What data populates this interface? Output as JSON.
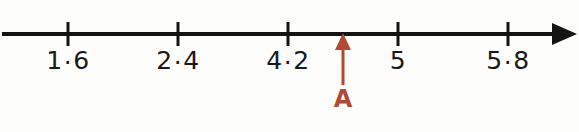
{
  "figure": {
    "type": "number-line",
    "background_color": "#fdfdfc",
    "axis_color": "#141414",
    "label_color": "#191919",
    "marker_color": "#b04a32",
    "decimal_separator": "·"
  },
  "axis": {
    "start_x": 2,
    "end_x": 577,
    "y": 34,
    "line_width": 4,
    "arrowhead": {
      "name": "right-arrowhead",
      "base_x": 552,
      "tip_x": 577,
      "half_height": 11
    }
  },
  "ticks": [
    {
      "label": "1·6",
      "value": 1.6,
      "x": 68
    },
    {
      "label": "2·4",
      "value": 2.4,
      "x": 178
    },
    {
      "label": "4·2",
      "value": 4.2,
      "x": 288
    },
    {
      "label": "5",
      "value": 5,
      "x": 398
    },
    {
      "label": "5·8",
      "value": 5.8,
      "x": 508
    }
  ],
  "marker": {
    "label": "A",
    "x": 343,
    "arrow_tip_y": 33,
    "arrow_head_base_y": 50,
    "shaft_bottom_y": 85,
    "label_y": 87,
    "color": "#b04a32"
  },
  "chart_data": {
    "type": "number-line",
    "title": "",
    "xlabel": "",
    "ylabel": "",
    "axis_direction": "right-arrow",
    "tick_labels": [
      "1·6",
      "2·4",
      "4·2",
      "5",
      "5·8"
    ],
    "tick_values": [
      1.6,
      2.4,
      4.2,
      5,
      5.8
    ],
    "tick_pixel_positions": [
      68,
      178,
      288,
      398,
      508
    ],
    "annotations": [
      {
        "label": "A",
        "pixel_x": 343,
        "between": [
          "4·2",
          "5"
        ],
        "style": "red up-arrow below axis"
      }
    ]
  }
}
